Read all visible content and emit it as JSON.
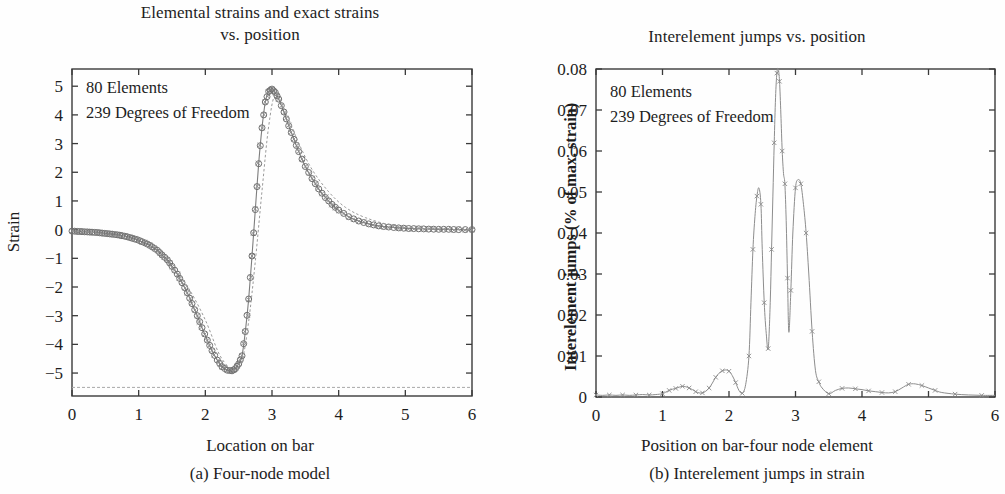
{
  "figure": {
    "panels": [
      {
        "id": "a",
        "title_line1": "Elemental strains and exact strains",
        "title_line2": "vs. position",
        "xlabel": "Location on bar",
        "ylabel": "Strain",
        "caption": "(a) Four-node model",
        "annotation_line1": "80 Elements",
        "annotation_line2": "239 Degrees of Freedom"
      },
      {
        "id": "b",
        "title_line1": "Interelement jumps vs. position",
        "title_line2": "",
        "xlabel": "Position on bar-four node element",
        "ylabel": "Interelement jumps (% of max. strain)",
        "caption": "(b) Interelement jumps in strain",
        "annotation_line1": "80 Elements",
        "annotation_line2": "239 Degrees of Freedom"
      }
    ]
  },
  "colors": {
    "axis": "#3a3a3a",
    "curve": "#7d7d7d",
    "marker": "#6f6f6f",
    "text": "#1d1d1d",
    "background": "#ffffff"
  },
  "chart_data": [
    {
      "type": "line",
      "panel": "a",
      "title": "Elemental strains and exact strains vs. position",
      "xlabel": "Location on bar",
      "ylabel": "Strain",
      "xlim": [
        0,
        6
      ],
      "ylim": [
        -5.8,
        5.6
      ],
      "xticks": [
        0,
        1,
        2,
        3,
        4,
        5,
        6
      ],
      "xticklabels": [
        "0",
        "1",
        "2",
        "3",
        "4",
        "5",
        "6"
      ],
      "yticks": [
        -5,
        -4,
        -3,
        -2,
        -1,
        0,
        1,
        2,
        3,
        4,
        5
      ],
      "yticklabels": [
        "−5",
        "−4",
        "−3",
        "−2",
        "−1",
        "0",
        "1",
        "2",
        "3",
        "4",
        "5"
      ],
      "grid": false,
      "legend": null,
      "annotations": [
        "80 Elements",
        "239 Degrees of Freedom"
      ],
      "series": [
        {
          "name": "Elemental strain (circle markers)",
          "marker": "o",
          "x": [
            0.0,
            0.08,
            0.15,
            0.23,
            0.3,
            0.38,
            0.45,
            0.53,
            0.6,
            0.68,
            0.75,
            0.83,
            0.9,
            0.98,
            1.05,
            1.13,
            1.2,
            1.28,
            1.35,
            1.43,
            1.5,
            1.58,
            1.65,
            1.73,
            1.8,
            1.88,
            1.95,
            2.03,
            2.1,
            2.18,
            2.25,
            2.33,
            2.4,
            2.45,
            2.5,
            2.55,
            2.6,
            2.65,
            2.7,
            2.75,
            2.8,
            2.85,
            2.9,
            2.95,
            3.0,
            3.05,
            3.1,
            3.18,
            3.25,
            3.33,
            3.4,
            3.5,
            3.6,
            3.7,
            3.8,
            3.9,
            4.0,
            4.15,
            4.3,
            4.45,
            4.6,
            4.75,
            4.9,
            5.05,
            5.2,
            5.35,
            5.5,
            5.65,
            5.8,
            6.0
          ],
          "y": [
            -0.05,
            -0.06,
            -0.07,
            -0.08,
            -0.09,
            -0.1,
            -0.12,
            -0.14,
            -0.16,
            -0.18,
            -0.21,
            -0.25,
            -0.3,
            -0.35,
            -0.42,
            -0.5,
            -0.6,
            -0.72,
            -0.88,
            -1.05,
            -1.28,
            -1.55,
            -1.85,
            -2.2,
            -2.58,
            -3.0,
            -3.42,
            -3.85,
            -4.22,
            -4.55,
            -4.78,
            -4.9,
            -4.92,
            -4.85,
            -4.68,
            -4.4,
            -3.55,
            -2.42,
            -0.92,
            0.7,
            2.3,
            3.55,
            4.45,
            4.82,
            4.9,
            4.78,
            4.55,
            4.1,
            3.62,
            3.15,
            2.72,
            2.2,
            1.78,
            1.42,
            1.12,
            0.88,
            0.68,
            0.45,
            0.3,
            0.2,
            0.13,
            0.09,
            0.06,
            0.04,
            0.03,
            0.02,
            0.01,
            0.01,
            0.0,
            0.0
          ]
        },
        {
          "name": "Exact strain (dashed)",
          "marker": "none",
          "x": [
            0.0,
            0.25,
            0.5,
            0.75,
            1.0,
            1.25,
            1.5,
            1.75,
            2.0,
            2.2,
            2.35,
            2.45,
            2.55,
            2.65,
            2.75,
            2.85,
            2.95,
            3.05,
            3.2,
            3.4,
            3.6,
            3.85,
            4.1,
            4.4,
            4.8,
            5.2,
            5.6,
            6.0
          ],
          "y": [
            -0.05,
            -0.09,
            -0.17,
            -0.26,
            -0.44,
            -0.78,
            -1.3,
            -2.05,
            -3.15,
            -4.3,
            -4.8,
            -4.92,
            -4.6,
            -3.2,
            -1.1,
            1.35,
            3.6,
            4.7,
            4.12,
            3.02,
            2.1,
            1.32,
            0.78,
            0.42,
            0.15,
            0.05,
            0.01,
            0.0
          ]
        },
        {
          "name": "Lower reference baseline",
          "marker": "none",
          "x": [
            0.0,
            6.0
          ],
          "y": [
            -5.5,
            -5.5
          ]
        }
      ]
    },
    {
      "type": "line",
      "panel": "b",
      "title": "Interelement jumps vs. position",
      "xlabel": "Position on bar-four node element",
      "ylabel": "Interelement jumps (% of max. strain)",
      "xlim": [
        0,
        6
      ],
      "ylim": [
        0,
        0.08
      ],
      "xticks": [
        0,
        1,
        2,
        3,
        4,
        5,
        6
      ],
      "xticklabels": [
        "0",
        "1",
        "2",
        "3",
        "4",
        "5",
        "6"
      ],
      "yticks": [
        0,
        0.01,
        0.02,
        0.03,
        0.04,
        0.05,
        0.06,
        0.07,
        0.08
      ],
      "yticklabels": [
        "0",
        "0.01",
        "0.02",
        "0.03",
        "0.04",
        "0.05",
        "0.06",
        "0.07",
        "0.08"
      ],
      "grid": false,
      "legend": null,
      "annotations": [
        "80 Elements",
        "239 Degrees of Freedom"
      ],
      "series": [
        {
          "name": "Interelement jump magnitude",
          "marker": "x",
          "x": [
            0.0,
            0.1,
            0.2,
            0.3,
            0.4,
            0.5,
            0.6,
            0.7,
            0.8,
            0.9,
            1.0,
            1.05,
            1.1,
            1.15,
            1.2,
            1.25,
            1.3,
            1.35,
            1.4,
            1.45,
            1.5,
            1.55,
            1.6,
            1.65,
            1.7,
            1.75,
            1.8,
            1.85,
            1.9,
            1.95,
            2.0,
            2.05,
            2.1,
            2.15,
            2.2,
            2.25,
            2.3,
            2.33,
            2.36,
            2.39,
            2.42,
            2.45,
            2.48,
            2.5,
            2.53,
            2.56,
            2.59,
            2.62,
            2.64,
            2.66,
            2.68,
            2.7,
            2.72,
            2.74,
            2.76,
            2.78,
            2.8,
            2.82,
            2.84,
            2.86,
            2.88,
            2.9,
            2.93,
            2.96,
            3.0,
            3.04,
            3.08,
            3.12,
            3.16,
            3.2,
            3.25,
            3.3,
            3.35,
            3.4,
            3.5,
            3.6,
            3.7,
            3.8,
            3.9,
            4.0,
            4.1,
            4.2,
            4.3,
            4.4,
            4.5,
            4.6,
            4.7,
            4.8,
            4.9,
            5.0,
            5.1,
            5.2,
            5.4,
            5.6,
            5.8,
            6.0
          ],
          "y": [
            0.0005,
            0.0004,
            0.0005,
            0.0004,
            0.0005,
            0.0004,
            0.0005,
            0.0006,
            0.0005,
            0.0006,
            0.0008,
            0.0012,
            0.0016,
            0.0019,
            0.0021,
            0.0024,
            0.0026,
            0.0025,
            0.0022,
            0.0018,
            0.0013,
            0.001,
            0.001,
            0.0014,
            0.0022,
            0.0034,
            0.0048,
            0.0058,
            0.0064,
            0.0066,
            0.0063,
            0.0052,
            0.0035,
            0.0016,
            0.0009,
            0.003,
            0.01,
            0.023,
            0.036,
            0.044,
            0.049,
            0.051,
            0.047,
            0.036,
            0.023,
            0.0155,
            0.0118,
            0.023,
            0.036,
            0.049,
            0.062,
            0.073,
            0.079,
            0.08,
            0.077,
            0.069,
            0.06,
            0.0545,
            0.052,
            0.043,
            0.029,
            0.0158,
            0.026,
            0.04,
            0.051,
            0.053,
            0.052,
            0.047,
            0.04,
            0.03,
            0.016,
            0.0065,
            0.0037,
            0.0022,
            0.0008,
            0.0016,
            0.0021,
            0.0022,
            0.002,
            0.0018,
            0.0015,
            0.0013,
            0.0011,
            0.001,
            0.0013,
            0.0022,
            0.0031,
            0.0032,
            0.0028,
            0.0022,
            0.0016,
            0.0011,
            0.0007,
            0.0005,
            0.0004,
            0.0004
          ]
        }
      ]
    }
  ]
}
